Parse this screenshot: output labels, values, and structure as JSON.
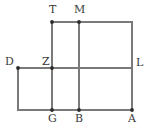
{
  "figure": {
    "kind": "geometry-diagram",
    "canvas": {
      "width": 151,
      "height": 129
    },
    "colors": {
      "background": "#ffffff",
      "stroke": "#7a7a7a",
      "vertex_dot": "#2b2b2b",
      "label_text": "#3a3a3a"
    },
    "stroke_width": 1.1,
    "vertex_dot_radius": 1.9,
    "labels": [
      {
        "id": "T",
        "text": "T",
        "x": 49,
        "y": 4,
        "point": {
          "x": 52,
          "y": 22
        }
      },
      {
        "id": "M",
        "text": "M",
        "x": 74,
        "y": 4,
        "point": {
          "x": 79,
          "y": 22
        }
      },
      {
        "id": "D",
        "text": "D",
        "x": 5,
        "y": 56,
        "point": {
          "x": 18,
          "y": 68
        }
      },
      {
        "id": "Z",
        "text": "Z",
        "x": 42,
        "y": 56,
        "point": {
          "x": 52,
          "y": 68
        }
      },
      {
        "id": "L",
        "text": "L",
        "x": 136,
        "y": 57,
        "point": {
          "x": 132,
          "y": 68
        }
      },
      {
        "id": "G",
        "text": "G",
        "x": 48,
        "y": 113,
        "point": {
          "x": 52,
          "y": 110
        }
      },
      {
        "id": "B",
        "text": "B",
        "x": 75,
        "y": 113,
        "point": {
          "x": 79,
          "y": 110
        }
      },
      {
        "id": "A",
        "text": "A",
        "x": 128,
        "y": 113,
        "point": {
          "x": 132,
          "y": 110
        }
      }
    ],
    "segments": [
      {
        "id": "top-edge",
        "x1": 52,
        "y1": 22,
        "x2": 132,
        "y2": 22
      },
      {
        "id": "middle-edge",
        "x1": 18,
        "y1": 68,
        "x2": 132,
        "y2": 68
      },
      {
        "id": "bottom-edge",
        "x1": 18,
        "y1": 110,
        "x2": 132,
        "y2": 110
      },
      {
        "id": "left-vertical-D",
        "x1": 18,
        "y1": 68,
        "x2": 18,
        "y2": 110
      },
      {
        "id": "vertical-T-Z-G",
        "x1": 52,
        "y1": 22,
        "x2": 52,
        "y2": 110
      },
      {
        "id": "vertical-M-B",
        "x1": 79,
        "y1": 22,
        "x2": 79,
        "y2": 110
      },
      {
        "id": "right-vertical-L-A",
        "x1": 132,
        "y1": 22,
        "x2": 132,
        "y2": 110
      }
    ],
    "vertices": [
      {
        "id": "T",
        "x": 52,
        "y": 22
      },
      {
        "id": "M",
        "x": 79,
        "y": 22
      },
      {
        "id": "D",
        "x": 18,
        "y": 68
      },
      {
        "id": "Z",
        "x": 52,
        "y": 68
      },
      {
        "id": "G",
        "x": 52,
        "y": 110
      },
      {
        "id": "B",
        "x": 79,
        "y": 110
      },
      {
        "id": "A",
        "x": 132,
        "y": 110
      }
    ]
  }
}
